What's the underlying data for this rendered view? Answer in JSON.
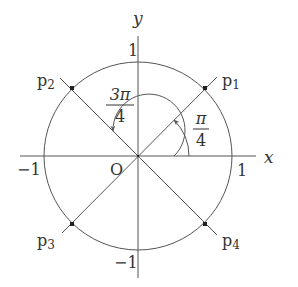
{
  "diagram": {
    "type": "unit-circle",
    "axes": {
      "x_label": "x",
      "y_label": "y",
      "origin_label": "O",
      "x_pos_tick": "1",
      "x_neg_tick": "−1",
      "y_pos_tick": "1",
      "y_neg_tick": "−1"
    },
    "points": [
      {
        "id": "p1",
        "label": "p",
        "sub": "1",
        "angle": "π/4"
      },
      {
        "id": "p2",
        "label": "p",
        "sub": "2",
        "angle": "3π/4"
      },
      {
        "id": "p3",
        "label": "p",
        "sub": "3",
        "angle": "5π/4"
      },
      {
        "id": "p4",
        "label": "p",
        "sub": "4",
        "angle": "7π/4"
      }
    ],
    "angles": [
      {
        "name": "pi-over-4",
        "numerator": "π",
        "denominator": "4"
      },
      {
        "name": "three-pi-over-4",
        "numerator": "3π",
        "denominator": "4"
      }
    ],
    "colors": {
      "stroke": "#555555",
      "text": "#333333"
    }
  }
}
